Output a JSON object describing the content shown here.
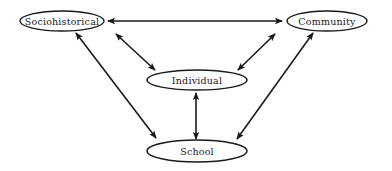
{
  "diagram": {
    "nodes": [
      {
        "id": "sociohistorical",
        "label": "Sociohistorical",
        "cx": 62,
        "cy": 21,
        "rx": 42,
        "ry": 10
      },
      {
        "id": "community",
        "label": "Community",
        "cx": 327,
        "cy": 21,
        "rx": 40,
        "ry": 10
      },
      {
        "id": "individual",
        "label": "Individual",
        "cx": 197,
        "cy": 80,
        "rx": 50,
        "ry": 10
      },
      {
        "id": "school",
        "label": "School",
        "cx": 197,
        "cy": 151,
        "rx": 50,
        "ry": 11
      }
    ],
    "edges": [
      {
        "from": "sociohistorical",
        "to": "community",
        "direction": "bidirectional"
      },
      {
        "from": "sociohistorical",
        "to": "individual",
        "direction": "bidirectional"
      },
      {
        "from": "community",
        "to": "individual",
        "direction": "bidirectional"
      },
      {
        "from": "sociohistorical",
        "to": "school",
        "direction": "bidirectional"
      },
      {
        "from": "community",
        "to": "school",
        "direction": "bidirectional"
      },
      {
        "from": "individual",
        "to": "school",
        "direction": "bidirectional"
      }
    ],
    "colors": {
      "stroke": "#1a1a1a",
      "fill": "#ffffff",
      "background": "#ffffff"
    }
  }
}
